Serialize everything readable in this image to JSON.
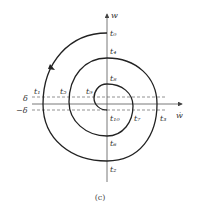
{
  "diagram": {
    "caption": "(c)",
    "axes": {
      "vertical_label": "w",
      "horizontal_label": "ẇ"
    },
    "thresholds": {
      "upper": "δ",
      "lower": "−δ"
    },
    "points": {
      "t0": "t₀",
      "t1": "t₁",
      "t2": "t₂",
      "t3": "t₃",
      "t4": "t₄",
      "t5": "t₅",
      "t6": "t₆",
      "t7": "t₇",
      "t8": "t₈",
      "t9": "t₉",
      "t10": "t₁₀"
    },
    "colors": {
      "curve": "#222222",
      "axis": "#555555",
      "dashed": "#777777"
    }
  }
}
